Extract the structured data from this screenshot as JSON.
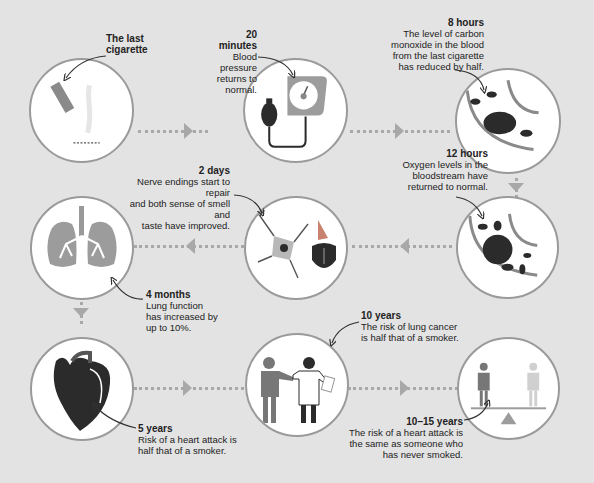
{
  "stages": [
    {
      "id": "last-cigarette",
      "title": "The last cigarette",
      "title_line1": "The last",
      "title_line2": "cigarette",
      "text_lines": []
    },
    {
      "id": "20-minutes",
      "title": "20 minutes",
      "text_lines": [
        "Blood pressure",
        "returns to normal."
      ]
    },
    {
      "id": "8-hours",
      "title": "8 hours",
      "text_lines": [
        "The level of carbon",
        "monoxide in the blood",
        "from the last cigarette",
        "has reduced by half."
      ]
    },
    {
      "id": "12-hours",
      "title": "12 hours",
      "text_lines": [
        "Oxygen levels in the",
        "bloodstream have",
        "returned to normal."
      ]
    },
    {
      "id": "2-days",
      "title": "2 days",
      "text_lines": [
        "Nerve endings start to repair",
        "and both sense of smell and",
        "taste have improved."
      ]
    },
    {
      "id": "4-months",
      "title": "4 months",
      "text_lines": [
        "Lung function",
        "has increased by",
        "up to 10%."
      ]
    },
    {
      "id": "5-years",
      "title": "5 years",
      "text_lines": [
        "Risk of a heart attack is",
        "half that of a smoker."
      ]
    },
    {
      "id": "10-years",
      "title": "10 years",
      "text_lines": [
        "The risk of lung cancer",
        "is half that of a smoker."
      ]
    },
    {
      "id": "10-15-years",
      "title": "10–15 years",
      "text_lines": [
        "The risk of a heart attack is",
        "the same as someone who",
        "has never smoked."
      ]
    }
  ],
  "icons": {
    "c1": "cigarette-icon",
    "c2": "blood-pressure-gauge-icon",
    "c3": "blood-cells-icon",
    "c4": "blood-cells-oxygen-icon",
    "c5": "nerve-cell-nose-tongue-icon",
    "c6": "lungs-icon",
    "c7": "heart-icon",
    "c8": "patient-doctor-icon",
    "c9": "balance-scale-people-icon"
  },
  "colors": {
    "background": "#e3e3e3",
    "circle_border": "#9a9a9a",
    "connector": "#a8a8a8",
    "dark": "#2b2b2b",
    "mid": "#8a8a8a",
    "accent": "#c8826e"
  }
}
